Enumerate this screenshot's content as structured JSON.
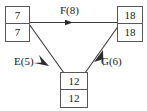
{
  "diagram": {
    "type": "directed-graph",
    "title": "",
    "background_color": "#ffffff",
    "line_color": "#3a3a3c",
    "box_border_color": "#58585a",
    "text_color": "#1b1b1b",
    "nodes": [
      {
        "id": "start",
        "name": "node-start",
        "top_value": "7",
        "bottom_value": "7",
        "x": 5,
        "y": 6,
        "w": 25,
        "h": 36
      },
      {
        "id": "end",
        "name": "node-end",
        "top_value": "18",
        "bottom_value": "18",
        "x": 117,
        "y": 6,
        "w": 26,
        "h": 36
      },
      {
        "id": "mid",
        "name": "node-mid",
        "top_value": "12",
        "bottom_value": "12",
        "x": 60,
        "y": 72,
        "w": 28,
        "h": 36
      }
    ],
    "edges": [
      {
        "id": "F",
        "label": "F(8)",
        "activity": "F",
        "duration": 8,
        "from": "start",
        "to": "end",
        "direction": "right",
        "x1": 30,
        "y1": 22,
        "x2": 117,
        "y2": 22,
        "arrow_x": 70,
        "arrow_y": 22
      },
      {
        "id": "E",
        "label": "E(5)",
        "activity": "E",
        "duration": 5,
        "from": "start",
        "to": "mid",
        "direction": "down-right",
        "x1": 29,
        "y1": 24,
        "x2": 63,
        "y2": 72,
        "arrow_x": 45,
        "arrow_y": 61
      },
      {
        "id": "G",
        "label": "G(6)",
        "activity": "G",
        "duration": 6,
        "from": "mid",
        "to": "end",
        "direction": "up-right",
        "x1": 86,
        "y1": 72,
        "x2": 118,
        "y2": 25,
        "arrow_x": 100,
        "arrow_y": 54
      }
    ]
  }
}
